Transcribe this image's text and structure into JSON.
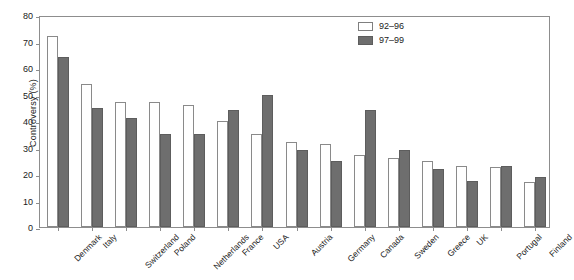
{
  "chart_data": {
    "type": "bar",
    "title": "",
    "xlabel": "",
    "ylabel": "Controversy (%)",
    "ylim": [
      0,
      80
    ],
    "ytick_values": [
      0,
      10,
      20,
      30,
      40,
      50,
      60,
      70,
      80
    ],
    "ytick_labels": [
      "0",
      "10",
      "20",
      "30",
      "40",
      "50",
      "60",
      "70",
      "80"
    ],
    "grid": false,
    "legend_position": "top-right",
    "categories": [
      "Denmark",
      "Italy",
      "Switzerland",
      "Poland",
      "Netherlands",
      "France",
      "USA",
      "Austria",
      "Germany",
      "Canada",
      "Sweden",
      "Greece",
      "UK",
      "Portugal",
      "Finland"
    ],
    "series": [
      {
        "name": "92–96",
        "color": "#ffffff",
        "values": [
          72,
          54,
          47,
          47,
          46,
          40,
          35,
          32,
          31.5,
          27,
          26,
          25,
          23,
          22.5,
          17
        ]
      },
      {
        "name": "97–99",
        "color": "#6e6e6e",
        "values": [
          64,
          45,
          41,
          35,
          35,
          44,
          50,
          29,
          25,
          44,
          29,
          22,
          17.5,
          23,
          19
        ]
      }
    ]
  },
  "legend": {
    "items": [
      {
        "label": "92–96",
        "swatch": "open-white-square"
      },
      {
        "label": "97–99",
        "swatch": "filled-gray-square"
      }
    ]
  }
}
